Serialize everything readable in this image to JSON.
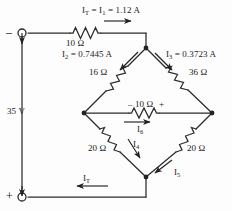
{
  "figure": {
    "type": "electrical-circuit-schematic",
    "line_color": "#2b2b2b",
    "text_color": "#1a1a1a",
    "background": "#fdfdfd"
  },
  "source": {
    "voltage_label": "35 V",
    "negative_terminal": "–",
    "positive_terminal": "+"
  },
  "currents": {
    "top_total": "I<sub>T</sub> = I<sub>1</sub> = 1.12 A",
    "i2": "I<sub>2</sub> = 0.7445 A",
    "i3": "I<sub>3</sub> = 0.3723 A",
    "i4": "I<sub>4</sub>",
    "i5": "I<sub>5</sub>",
    "i6": "I<sub>6</sub>",
    "bottom_total": "I<sub>T</sub>"
  },
  "resistors": {
    "series_top": "10 Ω",
    "upper_left": "16 Ω",
    "upper_right": "36 Ω",
    "bridge_middle": "10 Ω",
    "lower_left": "20 Ω",
    "lower_right": "20 Ω"
  },
  "polarity": {
    "bridge_minus": "–",
    "bridge_plus": "+"
  }
}
